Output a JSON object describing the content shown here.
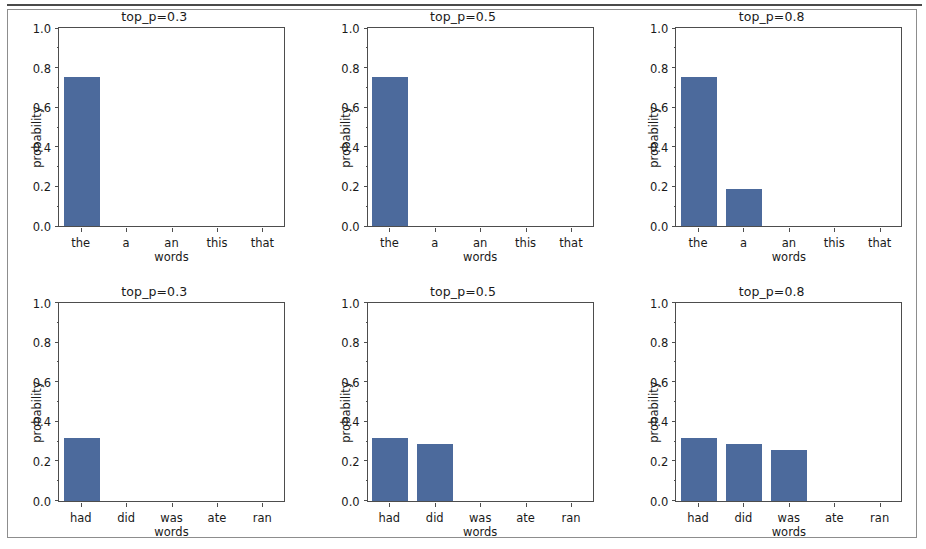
{
  "figure": {
    "bar_color": "#4c6a9c",
    "axis_color": "#4d4d4d",
    "frame_color": "#8d8d8d",
    "background": "#ffffff"
  },
  "chart_data": [
    {
      "type": "bar",
      "title": "top_p=0.3",
      "xlabel": "words",
      "ylabel": "probability",
      "categories": [
        "the",
        "a",
        "an",
        "this",
        "that"
      ],
      "values": [
        0.755,
        0.0,
        0.0,
        0.0,
        0.0
      ],
      "ylim": [
        0.0,
        1.0
      ],
      "yticks": [
        "0.0",
        "0.2",
        "0.4",
        "0.6",
        "0.8",
        "1.0"
      ],
      "grid": false,
      "legend": false
    },
    {
      "type": "bar",
      "title": "top_p=0.5",
      "xlabel": "words",
      "ylabel": "probability",
      "categories": [
        "the",
        "a",
        "an",
        "this",
        "that"
      ],
      "values": [
        0.755,
        0.0,
        0.0,
        0.0,
        0.0
      ],
      "ylim": [
        0.0,
        1.0
      ],
      "yticks": [
        "0.0",
        "0.2",
        "0.4",
        "0.6",
        "0.8",
        "1.0"
      ],
      "grid": false,
      "legend": false
    },
    {
      "type": "bar",
      "title": "top_p=0.8",
      "xlabel": "words",
      "ylabel": "probability",
      "categories": [
        "the",
        "a",
        "an",
        "this",
        "that"
      ],
      "values": [
        0.755,
        0.185,
        0.0,
        0.0,
        0.0
      ],
      "ylim": [
        0.0,
        1.0
      ],
      "yticks": [
        "0.0",
        "0.2",
        "0.4",
        "0.6",
        "0.8",
        "1.0"
      ],
      "grid": false,
      "legend": false
    },
    {
      "type": "bar",
      "title": "top_p=0.3",
      "xlabel": "words",
      "ylabel": "probability",
      "categories": [
        "had",
        "did",
        "was",
        "ate",
        "ran"
      ],
      "values": [
        0.318,
        0.0,
        0.0,
        0.0,
        0.0
      ],
      "ylim": [
        0.0,
        1.0
      ],
      "yticks": [
        "0.0",
        "0.2",
        "0.4",
        "0.6",
        "0.8",
        "1.0"
      ],
      "grid": false,
      "legend": false
    },
    {
      "type": "bar",
      "title": "top_p=0.5",
      "xlabel": "words",
      "ylabel": "probability",
      "categories": [
        "had",
        "did",
        "was",
        "ate",
        "ran"
      ],
      "values": [
        0.318,
        0.285,
        0.0,
        0.0,
        0.0
      ],
      "ylim": [
        0.0,
        1.0
      ],
      "yticks": [
        "0.0",
        "0.2",
        "0.4",
        "0.6",
        "0.8",
        "1.0"
      ],
      "grid": false,
      "legend": false
    },
    {
      "type": "bar",
      "title": "top_p=0.8",
      "xlabel": "words",
      "ylabel": "probability",
      "categories": [
        "had",
        "did",
        "was",
        "ate",
        "ran"
      ],
      "values": [
        0.318,
        0.285,
        0.255,
        0.0,
        0.0
      ],
      "ylim": [
        0.0,
        1.0
      ],
      "yticks": [
        "0.0",
        "0.2",
        "0.4",
        "0.6",
        "0.8",
        "1.0"
      ],
      "grid": false,
      "legend": false
    }
  ]
}
